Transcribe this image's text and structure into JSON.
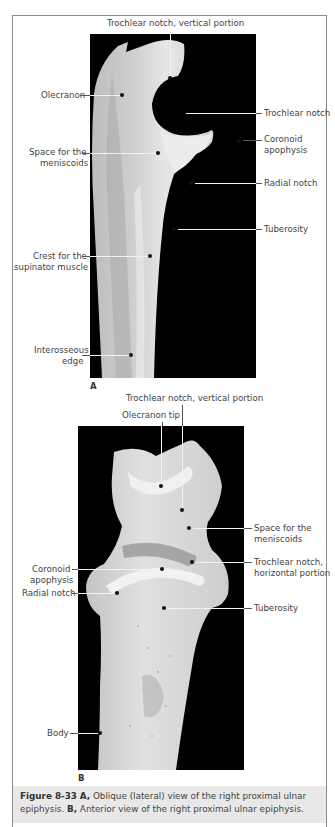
{
  "figure": {
    "number": "Figure 8-33",
    "panel_a_letter": "A",
    "panel_b_letter": "B",
    "caption": {
      "figure_label": "Figure 8-33",
      "a_label": "A,",
      "a_text": " Oblique (lateral) view of the right proximal ulnar epiphysis. ",
      "b_label": "B,",
      "b_text": " Anterior view of the right proximal ulnar epiphysis."
    }
  },
  "panel_a": {
    "labels": {
      "trochlear_vertical": "Trochlear notch, vertical portion",
      "olecranon": "Olecranon",
      "trochlear_notch": "Trochlear notch",
      "coronoid_1": "Coronoid",
      "coronoid_2": "apophysis",
      "meniscoids_1": "Space for the",
      "meniscoids_2": "meniscoids",
      "radial_notch": "Radial notch",
      "tuberosity": "Tuberosity",
      "crest_1": "Crest for the",
      "crest_2": "supinator muscle",
      "interosseous_1": "Interosseous",
      "interosseous_2": "edge"
    }
  },
  "panel_b": {
    "labels": {
      "trochlear_vertical": "Trochlear notch, vertical portion",
      "olecranon_tip": "Olecranon tip",
      "meniscoids_1": "Space for the",
      "meniscoids_2": "meniscoids",
      "coronoid_1": "Coronoid",
      "coronoid_2": "apophysis",
      "trochlear_horizontal_1": "Trochlear notch,",
      "trochlear_horizontal_2": "horizontal portion",
      "radial_notch": "Radial notch",
      "tuberosity": "Tuberosity",
      "body": "Body"
    }
  },
  "colors": {
    "photo_background": "#000000",
    "bone": "#d9d9d9",
    "caption_background": "#e8e8e8",
    "frame_border": "#8c8c8c"
  }
}
